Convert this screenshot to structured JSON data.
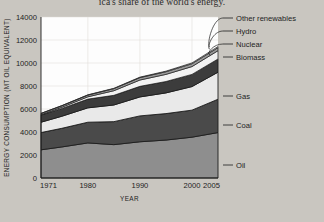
{
  "caption": "ica's share of the world's energy.",
  "axes": {
    "ylabel": "ENERGY CONSUMPTION (MT OIL EQUIVALENT)",
    "xlabel": "YEAR",
    "yticks": [
      "0",
      "2000",
      "4000",
      "6000",
      "8000",
      "10000",
      "12000",
      "14000"
    ],
    "xticks": [
      "1971",
      "1980",
      "1990",
      "2000",
      "2005"
    ]
  },
  "colors": {
    "oil": "#8e8e8e",
    "coal": "#4a4a4a",
    "gas": "#e9e9e9",
    "biomass": "#3c3c3c",
    "nuclear": "#f2f2f2",
    "hydro": "#9a9a9a",
    "other_renewables": "#ffffff",
    "plot_background": "#fdfdfd",
    "page_background": "#c9c6c0",
    "outline": "#1d1d1d"
  },
  "chart_data": {
    "type": "area",
    "title": "",
    "xlabel": "YEAR",
    "ylabel": "ENERGY CONSUMPTION (MT OIL EQUIVALENT)",
    "xlim": [
      1971,
      2005
    ],
    "ylim": [
      0,
      14000
    ],
    "ytick_step": 2000,
    "grid": true,
    "legend_position": "right",
    "stacked": true,
    "x": [
      1971,
      1975,
      1980,
      1985,
      1990,
      1995,
      2000,
      2005
    ],
    "series": [
      {
        "name": "Oil",
        "values": [
          2450,
          2700,
          3050,
          2900,
          3150,
          3300,
          3550,
          3950
        ]
      },
      {
        "name": "Coal",
        "values": [
          1500,
          1620,
          1800,
          2000,
          2250,
          2300,
          2350,
          2900
        ]
      },
      {
        "name": "Gas",
        "values": [
          900,
          1050,
          1250,
          1450,
          1650,
          1800,
          2050,
          2350
        ]
      },
      {
        "name": "Biomass",
        "values": [
          620,
          680,
          760,
          840,
          920,
          990,
          1060,
          1150
        ]
      },
      {
        "name": "Nuclear",
        "values": [
          30,
          100,
          200,
          400,
          550,
          620,
          680,
          720
        ]
      },
      {
        "name": "Hydro",
        "values": [
          110,
          130,
          150,
          180,
          210,
          230,
          250,
          270
        ]
      },
      {
        "name": "Other renewables",
        "values": [
          10,
          14,
          20,
          28,
          40,
          52,
          68,
          90
        ]
      }
    ],
    "totals": [
      5620,
      6294,
      7230,
      7798,
      8770,
      9292,
      10008,
      11430
    ]
  },
  "legend": [
    {
      "key": "other_renewables",
      "label": "Other renewables"
    },
    {
      "key": "hydro",
      "label": "Hydro"
    },
    {
      "key": "nuclear",
      "label": "Nuclear"
    },
    {
      "key": "biomass",
      "label": "Biomass"
    },
    {
      "key": "gas",
      "label": "Gas"
    },
    {
      "key": "coal",
      "label": "Coal"
    },
    {
      "key": "oil",
      "label": "Oil"
    }
  ]
}
